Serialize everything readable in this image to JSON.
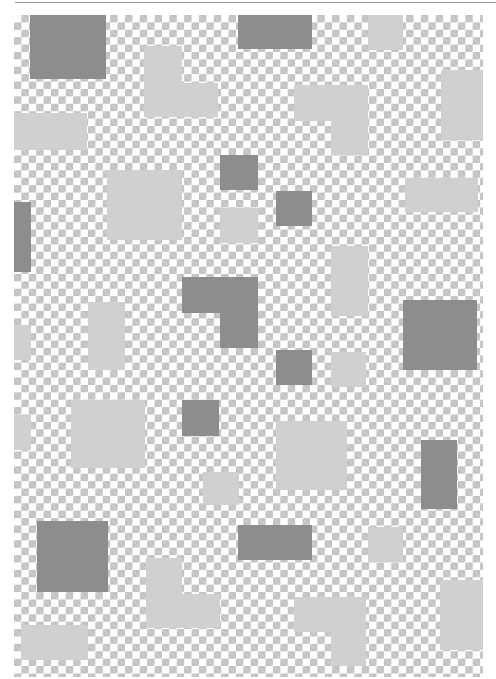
{
  "artwork": {
    "description": "Checkerboard composition with overlaid grey rectangles",
    "colors": {
      "checker_light": "#ffffff",
      "checker_dark": "#c3c3c3",
      "block_dark": "#8d8d8d",
      "block_light": "#d0d0d0"
    },
    "blocks": [
      {
        "tone": "dark",
        "x": 30,
        "y": 15,
        "w": 76,
        "h": 64
      },
      {
        "tone": "dark",
        "x": 238,
        "y": 15,
        "w": 74,
        "h": 34
      },
      {
        "tone": "light",
        "x": 368,
        "y": 15,
        "w": 35,
        "h": 35
      },
      {
        "tone": "light",
        "x": 144,
        "y": 46,
        "w": 38,
        "h": 38
      },
      {
        "tone": "light",
        "x": 144,
        "y": 83,
        "w": 74,
        "h": 34
      },
      {
        "tone": "light",
        "x": 294,
        "y": 85,
        "w": 74,
        "h": 36
      },
      {
        "tone": "light",
        "x": 331,
        "y": 120,
        "w": 37,
        "h": 35
      },
      {
        "tone": "light",
        "x": 441,
        "y": 70,
        "w": 42,
        "h": 70
      },
      {
        "tone": "light",
        "x": 14,
        "y": 113,
        "w": 73,
        "h": 37
      },
      {
        "tone": "dark",
        "x": 220,
        "y": 155,
        "w": 38,
        "h": 35
      },
      {
        "tone": "light",
        "x": 107,
        "y": 170,
        "w": 75,
        "h": 70
      },
      {
        "tone": "light",
        "x": 405,
        "y": 178,
        "w": 73,
        "h": 34
      },
      {
        "tone": "dark",
        "x": 276,
        "y": 191,
        "w": 36,
        "h": 35
      },
      {
        "tone": "light",
        "x": 220,
        "y": 208,
        "w": 38,
        "h": 35
      },
      {
        "tone": "dark",
        "x": 14,
        "y": 202,
        "w": 17,
        "h": 70
      },
      {
        "tone": "light",
        "x": 331,
        "y": 246,
        "w": 37,
        "h": 70
      },
      {
        "tone": "dark",
        "x": 182,
        "y": 277,
        "w": 76,
        "h": 36
      },
      {
        "tone": "dark",
        "x": 220,
        "y": 312,
        "w": 38,
        "h": 36
      },
      {
        "tone": "light",
        "x": 88,
        "y": 302,
        "w": 37,
        "h": 68
      },
      {
        "tone": "dark",
        "x": 403,
        "y": 300,
        "w": 74,
        "h": 70
      },
      {
        "tone": "light",
        "x": 14,
        "y": 325,
        "w": 17,
        "h": 35
      },
      {
        "tone": "dark",
        "x": 276,
        "y": 350,
        "w": 36,
        "h": 35
      },
      {
        "tone": "light",
        "x": 331,
        "y": 352,
        "w": 35,
        "h": 35
      },
      {
        "tone": "light",
        "x": 71,
        "y": 400,
        "w": 74,
        "h": 68
      },
      {
        "tone": "dark",
        "x": 182,
        "y": 400,
        "w": 37,
        "h": 36
      },
      {
        "tone": "light",
        "x": 14,
        "y": 415,
        "w": 17,
        "h": 35
      },
      {
        "tone": "light",
        "x": 276,
        "y": 421,
        "w": 71,
        "h": 69
      },
      {
        "tone": "dark",
        "x": 421,
        "y": 440,
        "w": 36,
        "h": 69
      },
      {
        "tone": "light",
        "x": 203,
        "y": 472,
        "w": 36,
        "h": 33
      },
      {
        "tone": "dark",
        "x": 37,
        "y": 521,
        "w": 71,
        "h": 71
      },
      {
        "tone": "dark",
        "x": 238,
        "y": 525,
        "w": 74,
        "h": 35
      },
      {
        "tone": "light",
        "x": 368,
        "y": 527,
        "w": 35,
        "h": 35
      },
      {
        "tone": "light",
        "x": 146,
        "y": 558,
        "w": 36,
        "h": 70
      },
      {
        "tone": "light",
        "x": 182,
        "y": 594,
        "w": 38,
        "h": 34
      },
      {
        "tone": "light",
        "x": 440,
        "y": 580,
        "w": 43,
        "h": 70
      },
      {
        "tone": "light",
        "x": 294,
        "y": 597,
        "w": 72,
        "h": 35
      },
      {
        "tone": "light",
        "x": 331,
        "y": 632,
        "w": 35,
        "h": 34
      },
      {
        "tone": "light",
        "x": 21,
        "y": 625,
        "w": 67,
        "h": 35
      }
    ]
  }
}
